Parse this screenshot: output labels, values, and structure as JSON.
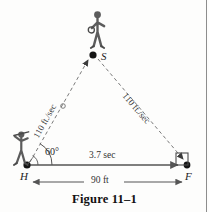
{
  "figure": {
    "caption": "Figure 11–1",
    "type": "geometry-diagram"
  },
  "vertices": [
    {
      "id": "H",
      "label": "H",
      "role": "home-plate",
      "x": 27,
      "y": 165
    },
    {
      "id": "S",
      "label": "S",
      "role": "shortstop",
      "x": 93,
      "y": 55
    },
    {
      "id": "F",
      "label": "F",
      "role": "first-base",
      "x": 187,
      "y": 165
    }
  ],
  "edges": [
    {
      "id": "H-S",
      "from": "H",
      "to": "S",
      "label": "110 ft./sec",
      "style": "dashed",
      "arrow": "to-S",
      "label_rotation_deg": -59
    },
    {
      "id": "S-F",
      "from": "S",
      "to": "F",
      "label": "110 ft./sec",
      "style": "dashed",
      "arrow": "to-F",
      "label_rotation_deg": 48
    },
    {
      "id": "H-F",
      "from": "H",
      "to": "F",
      "label": "3.7 sec",
      "style": "solid",
      "arrow": "to-F"
    }
  ],
  "dimensions": {
    "baseline_label": "90 ft",
    "baseline_arrow": "double",
    "time_label": "3.7 sec"
  },
  "angle": {
    "at_vertex": "H",
    "label": "60°",
    "value_deg": 60
  },
  "figures": [
    {
      "id": "batter",
      "name": "person-batter",
      "at": "H"
    },
    {
      "id": "fielder",
      "name": "person-fielder",
      "at": "S"
    }
  ],
  "marks": {
    "base_square_at": "F",
    "ball_marker_on_HS": true
  },
  "colors": {
    "line": "#555555",
    "dash": "#777777",
    "text": "#1c1c1c",
    "background": "#fdfdfc",
    "rule": "#8d8d8d"
  }
}
